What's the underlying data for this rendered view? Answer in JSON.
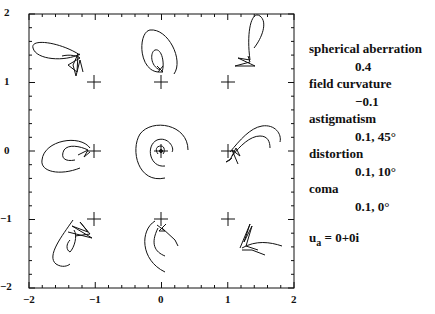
{
  "chart_data": {
    "type": "line",
    "title": "",
    "xlabel": "",
    "ylabel": "",
    "xlim": [
      -2,
      2
    ],
    "ylim": [
      -2,
      2
    ],
    "x_ticks": [
      "-2",
      "-1",
      "0",
      "1",
      "2"
    ],
    "y_ticks": [
      "2",
      "1",
      "0",
      "-1",
      "-2"
    ],
    "grid": false,
    "field_points": [
      {
        "x": -1,
        "y": 1
      },
      {
        "x": 0,
        "y": 1
      },
      {
        "x": 1,
        "y": 1
      },
      {
        "x": -1,
        "y": 0
      },
      {
        "x": 0,
        "y": 0
      },
      {
        "x": 1,
        "y": 0
      },
      {
        "x": -1,
        "y": -1
      },
      {
        "x": 0,
        "y": -1
      },
      {
        "x": 1,
        "y": -1
      }
    ],
    "annotations": [
      {
        "label": "spherical aberration",
        "value": "0.4"
      },
      {
        "label": "field curvature",
        "value": "−0.1"
      },
      {
        "label": "astigmatism",
        "value": "0.1, 45°"
      },
      {
        "label": "distortion",
        "value": "0.1, 10°"
      },
      {
        "label": "coma",
        "value": "0.1, 0°"
      }
    ],
    "ua": "0+0i"
  },
  "ticks": {
    "x": [
      "−2",
      "−1",
      "0",
      "1",
      "2"
    ],
    "y": [
      "2",
      "1",
      "0",
      "−1",
      "−2"
    ]
  },
  "legend": {
    "items": [
      {
        "name": "spherical aberration",
        "value": "0.4"
      },
      {
        "name": "field curvature",
        "value": "−0.1"
      },
      {
        "name": "astigmatism",
        "value": "0.1, 45°"
      },
      {
        "name": "distortion",
        "value": "0.1, 10°"
      },
      {
        "name": "coma",
        "value": "0.1, 0°"
      }
    ],
    "ua_label": "u",
    "ua_sub": "a",
    "ua_value": " = 0+0i"
  }
}
